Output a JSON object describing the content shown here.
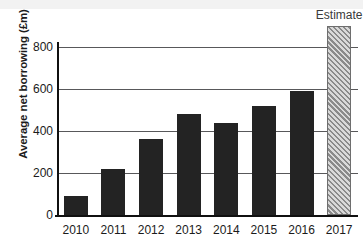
{
  "chart_data": {
    "type": "bar",
    "title": "",
    "xlabel": "",
    "ylabel": "Average net borrowing (£m)",
    "categories": [
      "2010",
      "2011",
      "2012",
      "2013",
      "2014",
      "2015",
      "2016",
      "2017"
    ],
    "values": [
      90,
      220,
      360,
      480,
      440,
      520,
      590,
      900
    ],
    "ylim": [
      0,
      800
    ],
    "yticks": [
      0,
      200,
      400,
      600,
      800
    ],
    "ytick_labels": [
      "0",
      "200",
      "400",
      "600",
      "800"
    ],
    "grid": true,
    "legend": "none",
    "series": [
      {
        "name": "Average net borrowing",
        "values": [
          90,
          220,
          360,
          480,
          440,
          520,
          590,
          900
        ]
      }
    ],
    "annotations": [
      {
        "text": "Estimate",
        "category": "2017",
        "note": "hatched bar denotes estimated value, extends above plotted axis range"
      }
    ],
    "bar_styles": [
      "solid",
      "solid",
      "solid",
      "solid",
      "solid",
      "solid",
      "solid",
      "hatched"
    ],
    "colors": {
      "bar_solid": "#232323",
      "bar_hatched_light": "#d9d9d9",
      "bar_hatched_dark": "#8a8a8a",
      "grid": "#58585a",
      "axis": "#101010",
      "text": "#1b1b1b"
    }
  }
}
